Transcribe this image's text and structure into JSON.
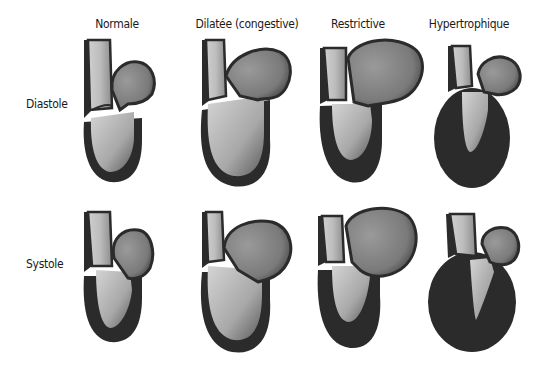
{
  "columns": [
    {
      "label": "Normale",
      "x": 117
    },
    {
      "label": "Dilatée (congestive)",
      "x": 247
    },
    {
      "label": "Restrictive",
      "x": 358
    },
    {
      "label": "Hypertrophique",
      "x": 469
    }
  ],
  "rows": [
    {
      "label": "Diastole",
      "y": 124
    },
    {
      "label": "Systole",
      "y": 264
    }
  ],
  "colors": {
    "wall": "#2b2b2b",
    "chamber_light": "#d2d2d2",
    "chamber_dark": "#6e6e6e",
    "atrium_light": "#b8b8b8",
    "atrium_dark": "#5a5a5a",
    "background": "#ffffff"
  }
}
